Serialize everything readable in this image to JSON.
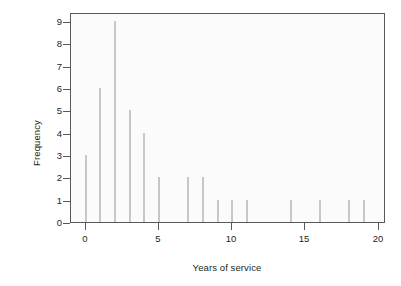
{
  "chart_data": {
    "type": "bar",
    "title": "",
    "subtitle": "",
    "xlabel": "Years of service",
    "ylabel": "Frequency",
    "xlim": [
      -1,
      20.5
    ],
    "ylim": [
      0,
      9.4
    ],
    "grid": false,
    "legend": null,
    "style": "R spike plot (histogram of counts per year)",
    "bar_color": "#c6c7c9",
    "panel_border_color": "#58585a",
    "panel_background": "#fbfbfb",
    "text_color": "#231f20",
    "xticks": [
      0,
      5,
      10,
      15,
      20
    ],
    "xtick_labels": [
      "0",
      "5",
      "10",
      "15",
      "20"
    ],
    "yticks": [
      0,
      1,
      2,
      3,
      4,
      5,
      6,
      7,
      8,
      9
    ],
    "ytick_labels": [
      "0",
      "1",
      "2",
      "3",
      "4",
      "5",
      "6",
      "7",
      "8",
      "9"
    ],
    "categories": [
      0,
      1,
      2,
      3,
      4,
      5,
      6,
      7,
      8,
      9,
      10,
      11,
      12,
      13,
      14,
      15,
      16,
      17,
      18,
      19
    ],
    "values": [
      3,
      6,
      9,
      5,
      4,
      2,
      0,
      2,
      2,
      1,
      1,
      1,
      0,
      0,
      1,
      0,
      1,
      0,
      1,
      1
    ],
    "points": [
      {
        "x": 0,
        "y": 3
      },
      {
        "x": 1,
        "y": 6
      },
      {
        "x": 2,
        "y": 9
      },
      {
        "x": 3,
        "y": 5
      },
      {
        "x": 4,
        "y": 4
      },
      {
        "x": 5,
        "y": 2
      },
      {
        "x": 6,
        "y": 0
      },
      {
        "x": 7,
        "y": 2
      },
      {
        "x": 8,
        "y": 2
      },
      {
        "x": 9,
        "y": 1
      },
      {
        "x": 10,
        "y": 1
      },
      {
        "x": 11,
        "y": 1
      },
      {
        "x": 12,
        "y": 0
      },
      {
        "x": 13,
        "y": 0
      },
      {
        "x": 14,
        "y": 1
      },
      {
        "x": 15,
        "y": 0
      },
      {
        "x": 16,
        "y": 1
      },
      {
        "x": 17,
        "y": 0
      },
      {
        "x": 18,
        "y": 1
      },
      {
        "x": 19,
        "y": 1
      }
    ]
  }
}
